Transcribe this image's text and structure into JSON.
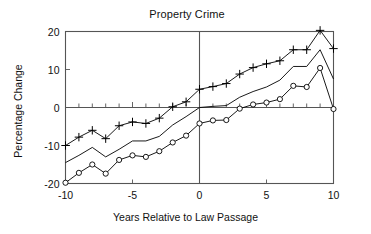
{
  "chart_data": {
    "type": "line",
    "title": "Property Crime",
    "xlabel": "Years Relative to Law Passage",
    "ylabel": "Percentage Change",
    "xlim": [
      -10,
      10
    ],
    "ylim": [
      -20,
      20
    ],
    "xticks": [
      -10,
      -5,
      0,
      5,
      10
    ],
    "xtick_labels": [
      "-10",
      "-5",
      "0",
      "5",
      "10"
    ],
    "yticks": [
      -20,
      -10,
      0,
      10,
      20
    ],
    "ytick_labels": [
      "-20",
      "-10",
      "0",
      "10",
      "20"
    ],
    "minor_xticks_every": 1,
    "grid": false,
    "legend": "none",
    "zero_line_vertical": 0,
    "zero_line_horizontal": 0,
    "x": [
      -10,
      -9,
      -8,
      -7,
      -6,
      -5,
      -4,
      -3,
      -2,
      -1,
      0,
      1,
      2,
      3,
      4,
      5,
      6,
      7,
      8,
      9,
      10
    ],
    "series": [
      {
        "name": "upper-confidence-band",
        "marker": "plus",
        "values": [
          -10.0,
          -7.8,
          -6.0,
          -8.2,
          -4.8,
          -3.8,
          -4.2,
          -2.8,
          0.2,
          1.5,
          4.8,
          5.5,
          6.3,
          8.8,
          10.5,
          11.5,
          12.3,
          15.2,
          15.2,
          20.3,
          15.5
        ]
      },
      {
        "name": "point-estimate",
        "marker": "none",
        "values": [
          -14.5,
          -12.6,
          -10.5,
          -13.0,
          -11.0,
          -8.8,
          -8.8,
          -7.6,
          -4.6,
          -2.4,
          0.0,
          0.3,
          0.5,
          2.7,
          4.2,
          5.4,
          7.2,
          10.8,
          10.8,
          15.2,
          7.5
        ]
      },
      {
        "name": "lower-confidence-band",
        "marker": "circle",
        "values": [
          -19.8,
          -17.2,
          -15.0,
          -17.4,
          -13.8,
          -12.6,
          -13.0,
          -11.5,
          -9.2,
          -7.4,
          -4.2,
          -3.4,
          -3.3,
          -0.3,
          0.8,
          1.3,
          2.2,
          5.7,
          5.4,
          10.4,
          -0.4
        ]
      }
    ],
    "colors": {
      "line": "#000000",
      "axis": "#555555",
      "text": "#111111",
      "background": "#ffffff"
    }
  }
}
